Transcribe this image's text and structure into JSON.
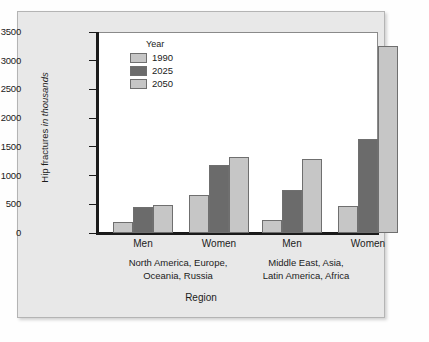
{
  "chart_data": {
    "type": "bar",
    "title": "",
    "xlabel": "Region",
    "ylabel": "Hip fractures in thousands",
    "ylabel_plain": "Hip fractures",
    "ylabel_italic": "in thousands",
    "ylim": [
      0,
      3500
    ],
    "yticks": [
      0,
      500,
      1000,
      1500,
      2000,
      2500,
      3000,
      3500
    ],
    "ytick_labels": [
      "0",
      "500",
      "1000",
      "1500",
      "2000",
      "2500",
      "3000",
      "3500"
    ],
    "grid": false,
    "legend_title": "Year",
    "legend_position": "inside-top-left",
    "series": [
      {
        "name": "1990",
        "color": "#c6c6c6",
        "values": [
          200,
          670,
          220,
          470
        ]
      },
      {
        "name": "2025",
        "color": "#6b6b6b",
        "values": [
          450,
          1180,
          750,
          1640
        ]
      },
      {
        "name": "2050",
        "color": "#c6c6c6",
        "values": [
          480,
          1320,
          1290,
          3250
        ]
      }
    ],
    "categories": [
      "Men",
      "Women",
      "Men",
      "Women"
    ],
    "groups": [
      {
        "label_line1": "North America, Europe,",
        "label_line2": "Oceania, Russia",
        "categories": [
          "Men",
          "Women"
        ]
      },
      {
        "label_line1": "Middle East, Asia,",
        "label_line2": "Latin America,  Africa",
        "categories": [
          "Men",
          "Women"
        ]
      }
    ]
  },
  "colors": {
    "bar_light": "#c6c6c6",
    "bar_dark": "#6b6b6b",
    "bar_outline": "#6f6f6f",
    "axis": "#1a1a1a",
    "panel_background": "#e8e8e8",
    "plot_background": "#ffffff",
    "text": "#1b1b1b"
  }
}
